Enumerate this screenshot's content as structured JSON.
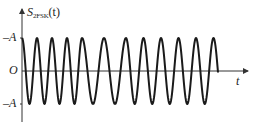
{
  "figure": {
    "y_axis_label_main": "S",
    "y_axis_label_sub": "2FSK",
    "y_axis_label_arg": "(t)",
    "x_axis_label": "t",
    "origin_label": "O",
    "top_level_label": "–A",
    "bottom_level_label": "–A"
  },
  "colors": {
    "waveform": "#1a1a1a",
    "axes": "#333333",
    "background": "#ffffff"
  },
  "chart_data": {
    "type": "line",
    "xlabel": "t",
    "ylabel": "S2FSK(t)",
    "ylim": [
      -1,
      1
    ],
    "y_ticks": [
      "A",
      "O",
      "-A"
    ],
    "grid": false,
    "segments": [
      {
        "name": "high-frequency burst",
        "x_start": 22,
        "x_end": 82,
        "period_px": 15,
        "cycles": 4
      },
      {
        "name": "low-frequency burst",
        "x_start": 82,
        "x_end": 126,
        "period_px": 22,
        "cycles": 2
      },
      {
        "name": "high-frequency burst",
        "x_start": 126,
        "x_end": 218,
        "period_px": 17.5,
        "cycles": 5.25
      }
    ],
    "amplitude": "A"
  }
}
